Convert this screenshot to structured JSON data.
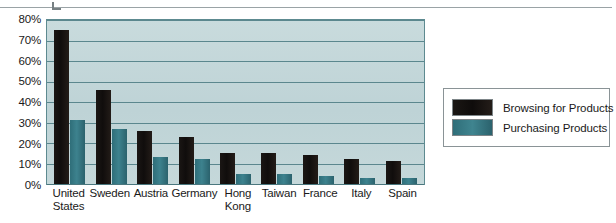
{
  "chart_data": {
    "type": "bar",
    "title": "",
    "xlabel": "",
    "ylabel": "",
    "ylim": [
      0,
      80
    ],
    "grid": true,
    "legend_position": "right",
    "ytick_labels": [
      "80%",
      "70%",
      "60%",
      "50%",
      "40%",
      "30%",
      "20%",
      "10%",
      "0%"
    ],
    "ytick_values": [
      80,
      70,
      60,
      50,
      40,
      30,
      20,
      10,
      0
    ],
    "categories": [
      "United States",
      "Sweden",
      "Austria",
      "Germany",
      "Hong Kong",
      "Taiwan",
      "France",
      "Italy",
      "Spain"
    ],
    "category_lines": [
      [
        "United",
        "States"
      ],
      [
        "Sweden"
      ],
      [
        "Austria"
      ],
      [
        "Germany"
      ],
      [
        "Hong",
        "Kong"
      ],
      [
        "Taiwan"
      ],
      [
        "France"
      ],
      [
        "Italy"
      ],
      [
        "Spain"
      ]
    ],
    "series": [
      {
        "name": "Browsing for Products",
        "color": "#15110f",
        "values": [
          75,
          46,
          26,
          23,
          15,
          15,
          14,
          12,
          11
        ]
      },
      {
        "name": "Purchasing Products",
        "color": "#3d828e",
        "values": [
          31,
          27,
          13,
          12,
          5,
          5,
          4,
          3,
          3
        ]
      }
    ]
  },
  "legend": {
    "items": [
      {
        "label": "Browsing for Products",
        "swatch": "browsing"
      },
      {
        "label": "Purchasing Products",
        "swatch": "purchasing"
      }
    ]
  },
  "colors": {
    "plot_background": "#c3d7d9",
    "gridline": "#5b878e",
    "axis_border": "#5d8a90",
    "browsing_bar": "#15110f",
    "purchasing_bar": "#3d828e",
    "legend_border": "#8a9396",
    "text": "#1a1a1a"
  }
}
